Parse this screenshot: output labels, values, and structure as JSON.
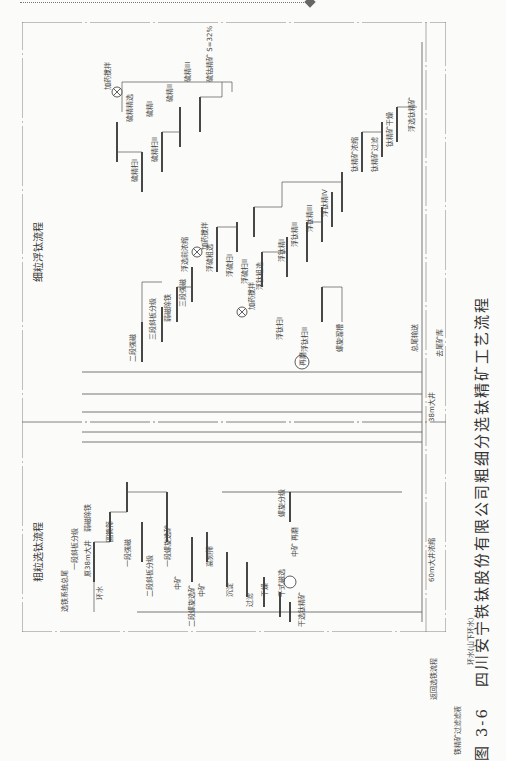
{
  "figure": {
    "number": "图 3-6",
    "caption": "四川安宁铁钛股份有限公司粗细分选钛精矿工艺流程",
    "orientation": "rotated 90° counter-clockwise"
  },
  "sections": {
    "coarse": "粗粒选钛流程",
    "fine": "细粒浮钛流程"
  },
  "coarse_labels": {
    "feed": "选铁系统总尾",
    "stage1_classify": "一段斜板分级",
    "pit38": "原38m大井",
    "weak_mag": "弱磁除铁",
    "drum_screen": "圆筒筛",
    "return_water": "环水",
    "stage1_strong": "一段强磁",
    "stage2_classify": "二段斜板分级",
    "stage1_spiral": "一段螺旋选矿",
    "middling1": "中矿",
    "stage2_spiral": "二段螺旋选矿",
    "middling2": "中矿",
    "high_screen": "高频筛",
    "settle": "沉淀",
    "filter": "过滤",
    "dry": "干燥",
    "dry_mag": "干式磁选",
    "dry_ti_conc": "干选钛精矿",
    "spiral_classify": "螺旋分级",
    "middling_regrind": "中矿 再磨"
  },
  "fine_labels": {
    "stage2_strong": "二段强磁",
    "stage3_classify": "三段斜板分级",
    "weak_mag2": "弱磁除铁",
    "stage3_strong": "三段强磁",
    "float_preconc": "浮选前浓缩",
    "agitate1": "加药搅拌",
    "s_rough": "浮硫粗选",
    "s_scav1": "浮硫扫I",
    "s_scav2": "浮硫扫II",
    "agitate2": "加药搅拌",
    "ti_rough": "浮钛粗选",
    "ti_scav1": "浮钛扫I",
    "ti_scav2": "浮钛扫II",
    "spiral_chute": "螺旋溜槽",
    "ti_clean1": "浮钛精I",
    "ti_clean2": "浮钛精II",
    "ti_clean3": "浮钛精III",
    "ti_clean4": "浮钛精IV",
    "regrind": "再磨",
    "ti_thicken": "钛精矿浓缩",
    "ti_filter": "钛精矿过滤",
    "ti_dry": "钛精矿干燥",
    "float_ti_conc": "浮选钛精矿",
    "agitate3": "加药搅拌",
    "s_clean_rough": "硫精精选",
    "s_clean1": "硫精I",
    "s_clean2": "硫精II",
    "s_clean3": "硫精III",
    "s_scav_a": "硫精扫I",
    "s_scav_b": "硫精扫II",
    "s_conc": "硫钴精矿 S=32%"
  },
  "bottom_labels": {
    "pit60": "60m大井浓缩",
    "pit38_2": "38m大井",
    "tail_out": "总尾输送",
    "to_tailings": "去尾矿库",
    "return_iron": "返回选铁流程",
    "iron_filtrate": "铁精矿过滤滤液",
    "return_water2": "环水(山下环水)"
  }
}
